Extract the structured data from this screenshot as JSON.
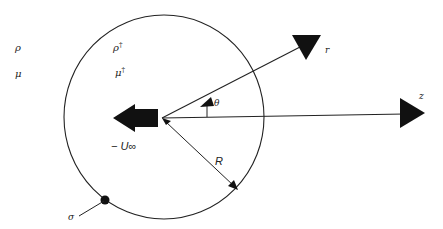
{
  "diagram": {
    "colors": {
      "stroke": "#222222",
      "fill": "#111111",
      "background": "#ffffff"
    },
    "labels": {
      "outer_density": "ρ",
      "outer_viscosity": "μ",
      "inner_density": "ρ",
      "inner_density_sup": "†",
      "inner_viscosity": "μ",
      "inner_viscosity_sup": "†",
      "r_axis": "r",
      "z_axis": "z",
      "theta": "θ",
      "velocity": "− U∞",
      "radius": "R",
      "surface_tension": "σ"
    }
  }
}
